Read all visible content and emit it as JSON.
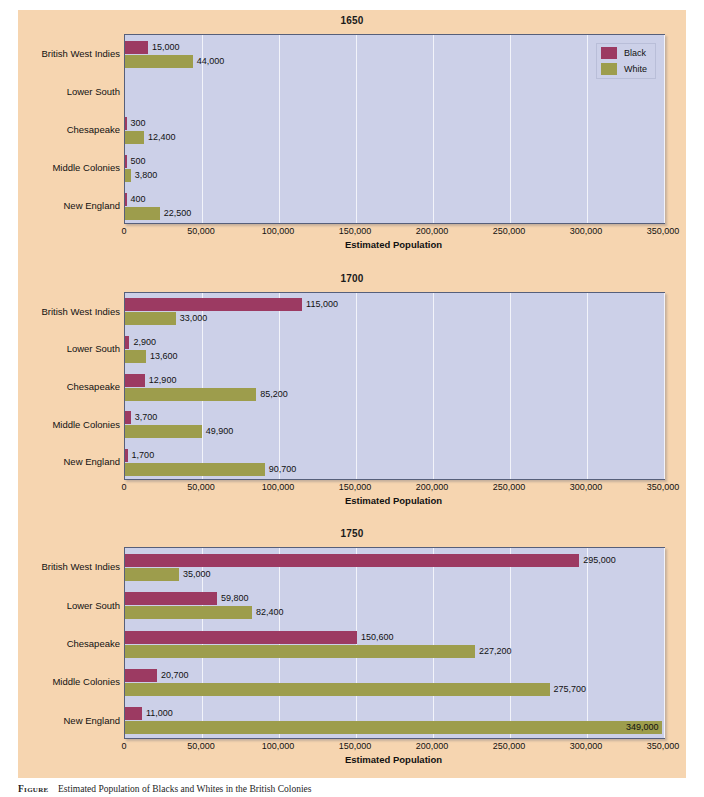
{
  "figure": {
    "caption_label": "Figure",
    "caption_number": "",
    "caption_text": "Estimated Population of Blacks and Whites in the British Colonies"
  },
  "legend": {
    "position": "top-right",
    "items": [
      {
        "label": "Black",
        "color": "#9c3a62"
      },
      {
        "label": "White",
        "color": "#9d9d4c"
      }
    ]
  },
  "axis": {
    "xlabel": "Estimated Population",
    "ticks": [
      "0",
      "50,000",
      "100,000",
      "150,000",
      "200,000",
      "250,000",
      "300,000",
      "350,000"
    ],
    "tick_values": [
      0,
      50000,
      100000,
      150000,
      200000,
      250000,
      300000,
      350000
    ],
    "xlim": [
      0,
      350000
    ]
  },
  "categories": [
    "British West Indies",
    "Lower South",
    "Chesapeake",
    "Middle Colonies",
    "New England"
  ],
  "chart_data": [
    {
      "type": "bar",
      "title": "1650",
      "orientation": "horizontal",
      "xlabel": "Estimated Population",
      "ylabel": "",
      "xlim": [
        0,
        350000
      ],
      "grid": true,
      "legend_position": "top-right",
      "categories": [
        "British West Indies",
        "Lower South",
        "Chesapeake",
        "Middle Colonies",
        "New England"
      ],
      "series": [
        {
          "name": "Black",
          "color": "#9c3a62",
          "values": [
            15000,
            0,
            300,
            500,
            400
          ],
          "labels": [
            "15,000",
            "",
            "300",
            "500",
            "400"
          ]
        },
        {
          "name": "White",
          "color": "#9d9d4c",
          "values": [
            44000,
            0,
            12400,
            3800,
            22500
          ],
          "labels": [
            "44,000",
            "",
            "12,400",
            "3,800",
            "22,500"
          ]
        }
      ]
    },
    {
      "type": "bar",
      "title": "1700",
      "orientation": "horizontal",
      "xlabel": "Estimated Population",
      "ylabel": "",
      "xlim": [
        0,
        350000
      ],
      "grid": true,
      "legend_position": "none",
      "categories": [
        "British West Indies",
        "Lower South",
        "Chesapeake",
        "Middle Colonies",
        "New England"
      ],
      "series": [
        {
          "name": "Black",
          "color": "#9c3a62",
          "values": [
            115000,
            2900,
            12900,
            3700,
            1700
          ],
          "labels": [
            "115,000",
            "2,900",
            "12,900",
            "3,700",
            "1,700"
          ]
        },
        {
          "name": "White",
          "color": "#9d9d4c",
          "values": [
            33000,
            13600,
            85200,
            49900,
            90700
          ],
          "labels": [
            "33,000",
            "13,600",
            "85,200",
            "49,900",
            "90,700"
          ]
        }
      ]
    },
    {
      "type": "bar",
      "title": "1750",
      "orientation": "horizontal",
      "xlabel": "Estimated Population",
      "ylabel": "",
      "xlim": [
        0,
        350000
      ],
      "grid": true,
      "legend_position": "none",
      "categories": [
        "British West Indies",
        "Lower South",
        "Chesapeake",
        "Middle Colonies",
        "New England"
      ],
      "series": [
        {
          "name": "Black",
          "color": "#9c3a62",
          "values": [
            295000,
            59800,
            150600,
            20700,
            11000
          ],
          "labels": [
            "295,000",
            "59,800",
            "150,600",
            "20,700",
            "11,000"
          ]
        },
        {
          "name": "White",
          "color": "#9d9d4c",
          "values": [
            35000,
            82400,
            227200,
            275700,
            349000
          ],
          "labels": [
            "35,000",
            "82,400",
            "227,200",
            "275,700",
            "349,000"
          ]
        }
      ]
    }
  ]
}
